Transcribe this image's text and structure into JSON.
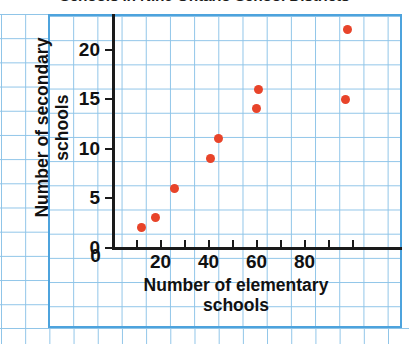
{
  "chart_data": {
    "type": "scatter",
    "title": "Schools in Nine Ontario School Districts",
    "xlabel_line1": "Number of elementary",
    "xlabel_line2": "schools",
    "ylabel_line1": "Number of secondary",
    "ylabel_line2": "schools",
    "xlabel": "Number of elementary schools",
    "ylabel": "Number of secondary schools",
    "xlim": [
      0,
      104
    ],
    "ylim": [
      0,
      24
    ],
    "xticks": [
      0,
      20,
      40,
      60,
      80
    ],
    "yticks": [
      0,
      5,
      10,
      15,
      20
    ],
    "grid": true,
    "grid_style": "graph-paper",
    "legend": null,
    "marker_color": "#e8442a",
    "grid_color": "#8ec4e8",
    "border_color": "#4da3dd",
    "axis_color": "#1a1a1a",
    "points": [
      {
        "x": 12,
        "y": 2
      },
      {
        "x": 18,
        "y": 3
      },
      {
        "x": 26,
        "y": 6
      },
      {
        "x": 41,
        "y": 9
      },
      {
        "x": 44,
        "y": 11
      },
      {
        "x": 60,
        "y": 14
      },
      {
        "x": 61,
        "y": 16
      },
      {
        "x": 97,
        "y": 15
      },
      {
        "x": 98,
        "y": 22
      }
    ]
  }
}
